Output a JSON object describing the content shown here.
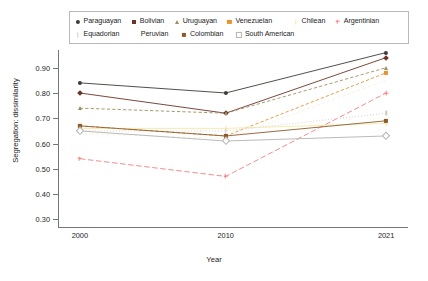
{
  "chart_data": {
    "type": "line",
    "title": "",
    "xlabel": "Year",
    "ylabel": "Segregation: dissimilarity",
    "x": [
      2000,
      2010,
      2021
    ],
    "xtick_labels": [
      "2000",
      "2010",
      "2021"
    ],
    "ytick_labels": [
      "0.30",
      "0.40",
      "0.50",
      "0.60",
      "0.70",
      "0.80",
      "0.90"
    ],
    "yticks": [
      0.3,
      0.4,
      0.5,
      0.6,
      0.7,
      0.8,
      0.9
    ],
    "ylim": [
      0.27,
      0.97
    ],
    "xlim": [
      1998.5,
      2022.5
    ],
    "grid": false,
    "legend_position": "top",
    "legend_columns": 6,
    "series": [
      {
        "name": "Paraguayan",
        "values": [
          0.84,
          0.8,
          0.96
        ],
        "color": "#3f3a38",
        "marker": "circle",
        "dash": "none"
      },
      {
        "name": "Bolivian",
        "values": [
          0.8,
          0.72,
          0.94
        ],
        "color": "#6d3326",
        "marker": "diamond",
        "dash": "none"
      },
      {
        "name": "Uruguayan",
        "values": [
          0.74,
          0.72,
          0.9
        ],
        "color": "#9c8f63",
        "marker": "triangle",
        "dash": "dashed"
      },
      {
        "name": "Venezuelan",
        "values": [
          0.67,
          0.63,
          0.88
        ],
        "color": "#e8922e",
        "marker": "square",
        "dash": "dashed"
      },
      {
        "name": "Chilean",
        "values": [
          0.66,
          0.66,
          0.68
        ],
        "color": "#f5e9a8",
        "marker": "tick",
        "dash": "none"
      },
      {
        "name": "Argentinian",
        "values": [
          0.54,
          0.47,
          0.8
        ],
        "color": "#f08080",
        "marker": "plus",
        "dash": "longdash"
      },
      {
        "name": "Equadorian",
        "values": [
          0.65,
          0.65,
          0.72
        ],
        "color": "#cfc9c2",
        "marker": "tick",
        "dash": "dotted"
      },
      {
        "name": "Peruvian",
        "values": [
          0.64,
          0.62,
          0.85
        ],
        "color": "#f7f2df",
        "marker": "none",
        "dash": "dashed"
      },
      {
        "name": "Colombian",
        "values": [
          0.67,
          0.63,
          0.69
        ],
        "color": "#8d5a2b",
        "marker": "square",
        "dash": "none"
      },
      {
        "name": "South American",
        "values": [
          0.65,
          0.61,
          0.63
        ],
        "color": "#b2b2b2",
        "marker": "open-diamond",
        "dash": "none"
      }
    ]
  },
  "legend": {
    "rows": [
      [
        "Paraguayan",
        "Bolivian",
        "Uruguayan",
        "Venezuelan",
        "Chilean",
        "Argentinian"
      ],
      [
        "Equadorian",
        "Peruvian",
        "Colombian",
        "South American"
      ]
    ]
  }
}
